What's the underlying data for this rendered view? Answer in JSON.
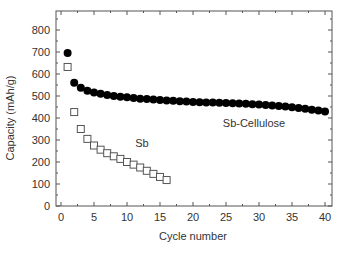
{
  "chart_data": {
    "type": "scatter",
    "title": "",
    "xlabel": "Cycle number",
    "ylabel": "Capacity (mAh/g)",
    "xlim": [
      -1,
      41
    ],
    "ylim": [
      0,
      900
    ],
    "xticks": [
      0,
      5,
      10,
      15,
      20,
      25,
      30,
      35,
      40
    ],
    "yticks": [
      0,
      100,
      200,
      300,
      400,
      500,
      600,
      700,
      800
    ],
    "grid": false,
    "legend": "none (inline annotations)",
    "series": [
      {
        "name": "Sb-Cellulose",
        "marker": "filled-circle",
        "color": "#000000",
        "x": [
          1,
          2,
          3,
          4,
          5,
          6,
          7,
          8,
          9,
          10,
          11,
          12,
          13,
          14,
          15,
          16,
          17,
          18,
          19,
          20,
          21,
          22,
          23,
          24,
          25,
          26,
          27,
          28,
          29,
          30,
          31,
          32,
          33,
          34,
          35,
          36,
          37,
          38,
          39,
          40
        ],
        "values": [
          695,
          560,
          537,
          524,
          516,
          510,
          505,
          500,
          497,
          494,
          491,
          488,
          486,
          484,
          482,
          480,
          478,
          476,
          475,
          473,
          472,
          471,
          470,
          469,
          468,
          467,
          466,
          465,
          463,
          461,
          459,
          457,
          455,
          452,
          449,
          446,
          442,
          438,
          434,
          430
        ]
      },
      {
        "name": "Sb",
        "marker": "open-square",
        "color": "#555555",
        "x": [
          1,
          2,
          3,
          4,
          5,
          6,
          7,
          8,
          9,
          10,
          11,
          12,
          13,
          14,
          15,
          16
        ],
        "values": [
          632,
          427,
          350,
          305,
          275,
          256,
          240,
          226,
          214,
          200,
          188,
          175,
          160,
          146,
          132,
          118
        ]
      }
    ],
    "annotations": [
      {
        "text": "Sb-Cellulose",
        "x": 30,
        "y": 380
      },
      {
        "text": "Sb",
        "x": 12,
        "y": 290
      }
    ]
  },
  "labels": {
    "xlabel": "Cycle number",
    "ylabel": "Capacity (mAh/g)",
    "annotation_sbcellulose": "Sb-Cellulose",
    "annotation_sb": "Sb"
  }
}
